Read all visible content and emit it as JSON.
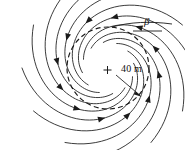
{
  "figure": {
    "kind": "vortex-streamline-diagram",
    "background_color": "#ffffff",
    "ink_color": "#1a1a1a",
    "width": 185,
    "height": 150
  },
  "labels": {
    "radius": "40 m",
    "angle": "β"
  },
  "core": {
    "center_x": 108,
    "center_y": 68,
    "radius_px": 41,
    "style": "dashed",
    "center_marker": "plus-mark"
  },
  "chart_data": {
    "type": "scatter",
    "title": "",
    "xlabel": "",
    "ylabel": "",
    "rotation_sense": "clockwise",
    "flow_direction": "inward",
    "core_radius_m": 40,
    "inflow_angle_symbol": "β",
    "streamline_count": 12,
    "spiral_model": {
      "type": "logarithmic",
      "r_start_px": 86,
      "r_end_px": 26,
      "pitch_b": 0.36
    },
    "streamlines": [
      {
        "id": 1,
        "start_angle_deg": 0,
        "arrow_count": 1
      },
      {
        "id": 2,
        "start_angle_deg": 30,
        "arrow_count": 1
      },
      {
        "id": 3,
        "start_angle_deg": 60,
        "arrow_count": 1
      },
      {
        "id": 4,
        "start_angle_deg": 90,
        "arrow_count": 1
      },
      {
        "id": 5,
        "start_angle_deg": 120,
        "arrow_count": 1
      },
      {
        "id": 6,
        "start_angle_deg": 150,
        "arrow_count": 1
      },
      {
        "id": 7,
        "start_angle_deg": 180,
        "arrow_count": 1
      },
      {
        "id": 8,
        "start_angle_deg": 210,
        "arrow_count": 1
      },
      {
        "id": 9,
        "start_angle_deg": 240,
        "arrow_count": 1
      },
      {
        "id": 10,
        "start_angle_deg": 270,
        "arrow_count": 1
      },
      {
        "id": 11,
        "start_angle_deg": 300,
        "arrow_count": 1
      },
      {
        "id": 12,
        "start_angle_deg": 330,
        "arrow_count": 1
      }
    ],
    "annotations": [
      {
        "name": "radius-label",
        "text": "40 m",
        "x": 122,
        "y": 70
      },
      {
        "name": "beta-label",
        "text": "β",
        "x": 146,
        "y": 22
      }
    ]
  }
}
